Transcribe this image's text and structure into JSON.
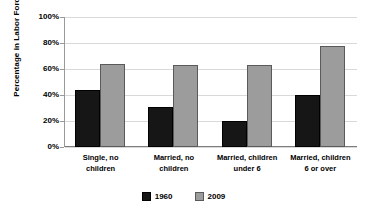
{
  "chart_data": {
    "type": "bar",
    "title": "",
    "xlabel": "",
    "ylabel": "Percentage in Labor Force",
    "ylim": [
      0,
      100
    ],
    "ytick_labels": [
      "0%",
      "20%",
      "40%",
      "60%",
      "80%",
      "100%"
    ],
    "ytick_values": [
      0,
      20,
      40,
      60,
      80,
      100
    ],
    "grid": true,
    "legend_position": "bottom-center",
    "categories": [
      "Single, no children",
      "Married, no children",
      "Married, children under 6",
      "Married, children 6 or over"
    ],
    "category_lines": [
      [
        "Single, no",
        "children"
      ],
      [
        "Married, no",
        "children"
      ],
      [
        "Married, children",
        "under 6"
      ],
      [
        "Married, children",
        "6 or over"
      ]
    ],
    "series": [
      {
        "name": "1960",
        "color": "#161616",
        "values": [
          44,
          31,
          20,
          40
        ]
      },
      {
        "name": "2009",
        "color": "#9c9c9c",
        "values": [
          64,
          63,
          63,
          78
        ]
      }
    ]
  }
}
